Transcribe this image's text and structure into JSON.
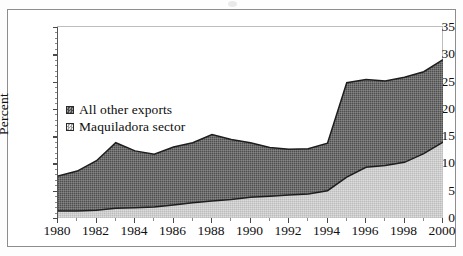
{
  "figure": {
    "ylabel": "Percent",
    "legend": [
      {
        "label": "All other exports",
        "color": "#6a6a6a",
        "swatch": "dark-hatch-swatch"
      },
      {
        "label": "Maquiladora sector",
        "color": "#c9c9c9",
        "swatch": "light-hatch-swatch"
      }
    ]
  },
  "chart_data": {
    "type": "area",
    "stacked": true,
    "title": "",
    "xlabel": "",
    "ylabel": "Percent",
    "xlim": [
      1980,
      2000
    ],
    "ylim": [
      0,
      35
    ],
    "ytick_step": 5,
    "xtick_step": 2,
    "grid": false,
    "legend_position": "inside-upper-left",
    "x": [
      1980,
      1981,
      1982,
      1983,
      1984,
      1985,
      1986,
      1987,
      1988,
      1989,
      1990,
      1991,
      1992,
      1993,
      1994,
      1995,
      1996,
      1997,
      1998,
      1999,
      2000
    ],
    "xtick_labels": [
      "1980",
      "1982",
      "1984",
      "1986",
      "1988",
      "1990",
      "1992",
      "1994",
      "1996",
      "1998",
      "2000"
    ],
    "ytick_labels": [
      "0",
      "5",
      "10",
      "15",
      "20",
      "25",
      "30",
      "35"
    ],
    "series": [
      {
        "name": "Maquiladora sector",
        "color": "#c9c9c9",
        "values": [
          1.3,
          1.3,
          1.4,
          1.8,
          1.9,
          2.0,
          2.4,
          2.8,
          3.1,
          3.4,
          3.8,
          4.0,
          4.2,
          4.4,
          5.0,
          7.5,
          9.3,
          9.6,
          10.2,
          11.8,
          13.9
        ]
      },
      {
        "name": "All other exports",
        "color": "#6a6a6a",
        "values": [
          6.4,
          7.3,
          9.1,
          12.0,
          10.4,
          9.7,
          10.6,
          11.0,
          12.2,
          11.0,
          10.0,
          8.9,
          8.4,
          8.3,
          8.7,
          17.3,
          16.1,
          15.5,
          15.6,
          15.0,
          15.1
        ]
      }
    ],
    "totals": [
      7.7,
      8.6,
      10.5,
      13.8,
      12.3,
      11.7,
      13.0,
      13.8,
      15.3,
      14.4,
      13.8,
      12.9,
      12.6,
      12.7,
      13.7,
      24.8,
      25.4,
      25.1,
      25.8,
      26.8,
      29.0
    ]
  }
}
